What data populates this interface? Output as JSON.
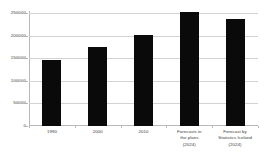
{
  "chart_data": {
    "type": "bar",
    "title": "",
    "subtitle": "",
    "xlabel": "",
    "ylabel": "",
    "categories": [
      "1990",
      "2000",
      "2010",
      "Forecasts in the plans (2024)",
      "Forecast by Statistics Iceland (2024)"
    ],
    "category_lines": [
      [
        "1990"
      ],
      [
        "2000"
      ],
      [
        "2010"
      ],
      [
        "Forecasts in",
        "the plans",
        "(2024)"
      ],
      [
        "Forecast by",
        "Statistics Iceland",
        "(2024)"
      ]
    ],
    "values": [
      146000,
      175000,
      201000,
      252000,
      237000
    ],
    "ylim": [
      0,
      250000
    ],
    "yticks": [
      0,
      50000,
      100000,
      150000,
      200000,
      250000
    ],
    "ytick_labels": [
      "0",
      "50000",
      "100000",
      "150000",
      "200000",
      "250000"
    ],
    "grid": true,
    "legend": false,
    "legend_position": "none",
    "bar_color": "#0a0a0a",
    "grid_color": "#d3d3d3",
    "axis_color": "#b9b9b9",
    "text_color": "#3a3a3a",
    "background_color": "#ffffff"
  }
}
